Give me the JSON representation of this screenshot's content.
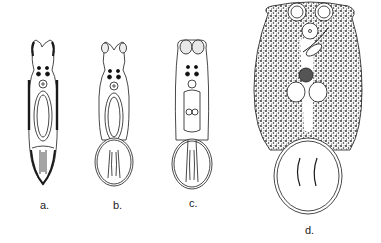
{
  "figure": {
    "panels": [
      {
        "id": "a",
        "label": "a.",
        "description": "Elongate larval form with spiny lateral margins, two eye pairs, pharynx and posterior developing sucker"
      },
      {
        "id": "b",
        "label": "b.",
        "description": "Form with anterior suckers, eye spots, pharynx, and rounded posterior ventral disc with hooks"
      },
      {
        "id": "c",
        "label": "c.",
        "description": "Form with large anterior suckers, eye spots, testes, and posterior attachment disc"
      },
      {
        "id": "d",
        "label": "d.",
        "description": "Adult form with dense vitelline stippling, anterior suckers, pharynx, ovary, testes and posterior haptor with hooks"
      }
    ]
  },
  "colors": {
    "ink": "#1a1a1a",
    "background": "#ffffff",
    "stipple": "#2a2a2a"
  }
}
